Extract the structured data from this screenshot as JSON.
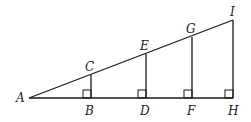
{
  "diagram": {
    "type": "geometry",
    "points": {
      "A": {
        "label": "A",
        "x": 29,
        "y": 98
      },
      "B": {
        "label": "B",
        "x": 91,
        "y": 98
      },
      "C": {
        "label": "C",
        "x": 91,
        "y": 75
      },
      "D": {
        "label": "D",
        "x": 146,
        "y": 98
      },
      "E": {
        "label": "E",
        "x": 146,
        "y": 54
      },
      "F": {
        "label": "F",
        "x": 192,
        "y": 98
      },
      "G": {
        "label": "G",
        "x": 192,
        "y": 37
      },
      "H": {
        "label": "H",
        "x": 233,
        "y": 98
      },
      "I": {
        "label": "I",
        "x": 233,
        "y": 20
      }
    },
    "segments": [
      [
        "A",
        "H"
      ],
      [
        "A",
        "I"
      ],
      [
        "B",
        "C"
      ],
      [
        "D",
        "E"
      ],
      [
        "F",
        "G"
      ],
      [
        "H",
        "I"
      ]
    ],
    "right_angles": [
      "B",
      "D",
      "F",
      "H"
    ],
    "colors": {
      "stroke": "#1a1a1a",
      "label": "#222222",
      "background": "#ffffff"
    }
  }
}
